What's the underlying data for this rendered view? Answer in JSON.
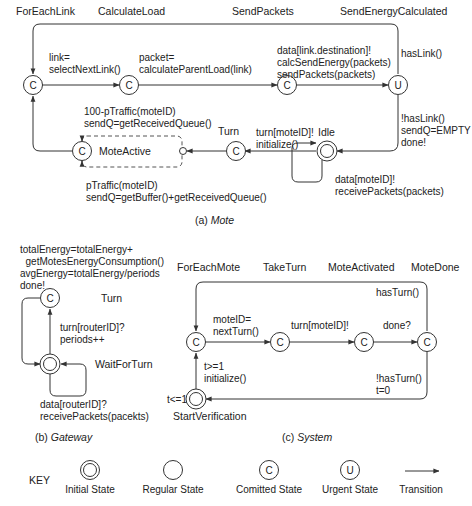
{
  "mote": {
    "caption_prefix": "(a) ",
    "caption_name": "Mote",
    "states": {
      "for_each_link": "ForEachLink",
      "calculate_load": "CalculateLoad",
      "send_packets": "SendPackets",
      "send_energy_calculated": "SendEnergyCalculated",
      "mote_active": "MoteActive",
      "turn": "Turn",
      "idle": "Idle"
    },
    "node_letters": {
      "committed": "C",
      "urgent": "U"
    },
    "transitions": {
      "select_link": [
        "link=",
        "selectNextLink()"
      ],
      "calc_load": [
        "packet=",
        "calculateParentLoad(link)"
      ],
      "send": [
        "data[link.destination]!",
        "calcSendEnergy(packets)",
        "sendPackets(packets)"
      ],
      "has_link": [
        "hasLink()"
      ],
      "no_link": [
        "!hasLink()",
        "sendQ=EMPTY",
        "done!"
      ],
      "turn_init": [
        "turn[moteID]!",
        "initialize()"
      ],
      "idle_receive": [
        "data[moteID]!",
        "receivePackets(packets)"
      ],
      "traffic_received": [
        "100-pTraffic(moteID)",
        "sendQ=getReceivedQueue()"
      ],
      "traffic_buffer": [
        "pTraffic(moteID)",
        "sendQ=getBuffer()+getReceivedQueue()"
      ]
    }
  },
  "gateway": {
    "caption_prefix": "(b) ",
    "caption_name": "Gateway",
    "states": {
      "turn": "Turn",
      "wait_for_turn": "WaitForTurn"
    },
    "transitions": {
      "energy": [
        "totalEnergy=totalEnergy+",
        "  getMotesEnergyConsumption()",
        "avgEnergy=totalEnergy/periods",
        "done!"
      ],
      "turn": [
        "turn[routerID]?",
        "periods++"
      ],
      "receive": [
        "data[routerID]?",
        "receivePackets(pacekts)"
      ]
    }
  },
  "system": {
    "caption_prefix": "(c) ",
    "caption_name": "System",
    "states": {
      "for_each_mote": "ForEachMote",
      "take_turn": "TakeTurn",
      "mote_activated": "MoteActivated",
      "mote_done": "MoteDone",
      "start_verification": "StartVerification"
    },
    "transitions": {
      "next_turn": [
        "moteID=",
        "nextTurn()"
      ],
      "turn": [
        "turn[moteID]!"
      ],
      "done": [
        "done?"
      ],
      "has_turn": [
        "hasTurn()"
      ],
      "no_turn": [
        "!hasTurn()",
        "t=0"
      ],
      "init": [
        "t>=1",
        "initialize()"
      ],
      "invariant": [
        "t<=1"
      ]
    }
  },
  "key": {
    "title": "KEY",
    "items": [
      {
        "label": "Initial State",
        "symbol": ""
      },
      {
        "label": "Regular State",
        "symbol": ""
      },
      {
        "label": "Comitted State",
        "symbol": "C"
      },
      {
        "label": "Urgent State",
        "symbol": "U"
      },
      {
        "label": "Transition",
        "symbol": ""
      }
    ]
  }
}
